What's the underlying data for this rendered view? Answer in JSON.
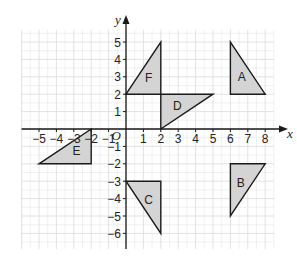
{
  "diagram": {
    "type": "coordinate-grid",
    "origin_label": "O",
    "x_axis": {
      "label": "x",
      "min": -5,
      "max": 8,
      "ticks": [
        -5,
        -4,
        -3,
        -2,
        -1,
        1,
        2,
        3,
        4,
        5,
        6,
        7,
        8
      ]
    },
    "y_axis": {
      "label": "y",
      "min": -6,
      "max": 5,
      "ticks": [
        5,
        4,
        3,
        2,
        1,
        -1,
        -2,
        -3,
        -4,
        -5,
        -6
      ]
    },
    "grid_range": {
      "x": [
        -6,
        8.5
      ],
      "y": [
        -6.9,
        5.7
      ]
    },
    "colors": {
      "fill": "#d4d4d4",
      "stroke": "#1a1a1a",
      "grid": "#e2e2e2",
      "axis": "#1a1a1a"
    },
    "shapes": [
      {
        "label": "A",
        "vertices": [
          [
            6,
            5
          ],
          [
            6,
            2
          ],
          [
            8,
            2
          ]
        ],
        "label_pos": [
          6.65,
          3.0
        ]
      },
      {
        "label": "B",
        "vertices": [
          [
            6,
            -2
          ],
          [
            8,
            -2
          ],
          [
            6,
            -5
          ]
        ],
        "label_pos": [
          6.6,
          -3.1
        ]
      },
      {
        "label": "C",
        "vertices": [
          [
            0,
            -3
          ],
          [
            2,
            -3
          ],
          [
            2,
            -6
          ]
        ],
        "label_pos": [
          1.3,
          -4.1
        ]
      },
      {
        "label": "D",
        "vertices": [
          [
            2,
            2
          ],
          [
            5,
            2
          ],
          [
            2,
            0
          ]
        ],
        "label_pos": [
          2.95,
          1.35
        ]
      },
      {
        "label": "E",
        "vertices": [
          [
            -2,
            0
          ],
          [
            -2,
            -2
          ],
          [
            -5,
            -2
          ]
        ],
        "label_pos": [
          -2.85,
          -1.25
        ]
      },
      {
        "label": "F",
        "vertices": [
          [
            0,
            2
          ],
          [
            2,
            5
          ],
          [
            2,
            2
          ]
        ],
        "label_pos": [
          1.3,
          2.95
        ]
      }
    ]
  }
}
